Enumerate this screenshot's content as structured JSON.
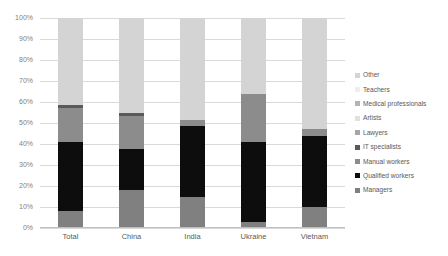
{
  "chart_data": {
    "type": "bar",
    "subtype": "stacked-bar-100-percent",
    "title": "",
    "xlabel": "",
    "ylabel": "",
    "ylim": [
      0,
      100
    ],
    "grid": true,
    "legend_position": "right",
    "categories": [
      "Total",
      "China",
      "India",
      "Ukraine",
      "Vietnam"
    ],
    "y_ticks": [
      "0%",
      "10%",
      "20%",
      "30%",
      "40%",
      "50%",
      "60%",
      "70%",
      "80%",
      "90%",
      "100%"
    ],
    "y_tick_values": [
      0,
      10,
      20,
      30,
      40,
      50,
      60,
      70,
      80,
      90,
      100
    ],
    "series": [
      {
        "name": "Managers",
        "color": "#808080",
        "values": [
          8.0,
          18.0,
          15.0,
          3.0,
          10.0
        ]
      },
      {
        "name": "Qualified workers",
        "color": "#0d0d0d",
        "values": [
          33.0,
          19.5,
          33.5,
          38.0,
          34.0
        ]
      },
      {
        "name": "Manual workers",
        "color": "#8c8c8c",
        "values": [
          16.0,
          16.0,
          3.0,
          23.0,
          3.0
        ]
      },
      {
        "name": "IT specialists",
        "color": "#5a5a5a",
        "values": [
          1.5,
          1.5,
          0.0,
          0.0,
          0.0
        ]
      },
      {
        "name": "Lawyers",
        "color": "#a6a6a6",
        "values": [
          0.0,
          0.0,
          0.0,
          0.0,
          0.0
        ]
      },
      {
        "name": "Artists",
        "color": "#e0e0e0",
        "values": [
          0.0,
          0.0,
          0.0,
          0.0,
          0.0
        ]
      },
      {
        "name": "Medical professionals",
        "color": "#b3b3b3",
        "values": [
          0.0,
          0.0,
          0.0,
          0.0,
          0.0
        ]
      },
      {
        "name": "Teachers",
        "color": "#ededed",
        "values": [
          0.0,
          0.0,
          0.0,
          0.0,
          0.0
        ]
      },
      {
        "name": "Other",
        "color": "#d4d4d4",
        "values": [
          41.5,
          45.0,
          48.5,
          36.0,
          53.0
        ]
      }
    ],
    "legend_entries": [
      {
        "label": "Other",
        "color": "#d4d4d4"
      },
      {
        "label": "Teachers",
        "color": "#ededed"
      },
      {
        "label": "Medical professionals",
        "color": "#b3b3b3"
      },
      {
        "label": "Artists",
        "color": "#e0e0e0"
      },
      {
        "label": "Lawyers",
        "color": "#a6a6a6"
      },
      {
        "label": "IT specialists",
        "color": "#5a5a5a"
      },
      {
        "label": "Manual workers",
        "color": "#8c8c8c"
      },
      {
        "label": "Qualified workers",
        "color": "#0d0d0d"
      },
      {
        "label": "Managers",
        "color": "#808080"
      }
    ]
  }
}
